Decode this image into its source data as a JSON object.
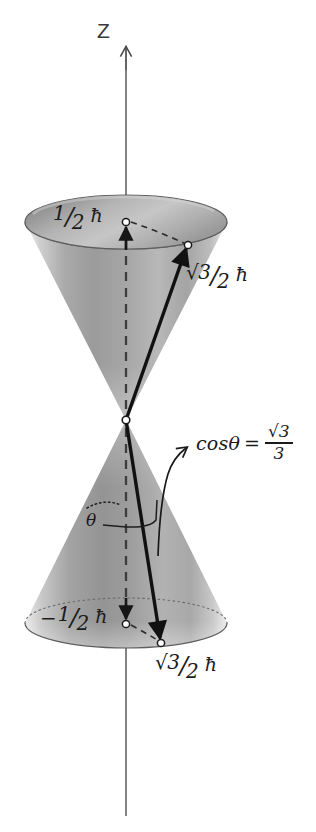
{
  "figure": {
    "axis": {
      "name": "z-axis",
      "label": "Z"
    },
    "labels": {
      "upper_projection": {
        "sign": "",
        "numerator": "1",
        "slash": "/",
        "denominator": "2",
        "unit": "ħ",
        "plain": "1/2 ħ"
      },
      "upper_vector": {
        "radical": "√3",
        "slash": "/",
        "denominator": "2",
        "unit": "ħ",
        "plain": "√3/2 ħ"
      },
      "lower_projection": {
        "sign": "−",
        "numerator": "1",
        "slash": "/",
        "denominator": "2",
        "unit": "ħ",
        "plain": "−1/2 ħ"
      },
      "lower_vector": {
        "radical": "√3",
        "slash": "/",
        "denominator": "2",
        "unit": "ħ",
        "plain": "√3/2 ħ"
      },
      "angle": {
        "symbol": "θ"
      },
      "cos_annotation": {
        "lhs": "cosθ",
        "equals": "=",
        "numerator": "√3",
        "denominator": "3",
        "plain": "cosθ = √3/3"
      }
    },
    "colors": {
      "ink": "#1c1c1c",
      "axis_line": "#555555",
      "cone_light": "#e2e2e2",
      "cone_mid": "#b4b4b4",
      "cone_dark": "#8c8c8c",
      "ellipse_top_dark": "#8a8a8a",
      "ellipse_top_light": "#d2d2d2",
      "marker_fill": "#ffffff",
      "background": "#ffffff"
    },
    "geometry": {
      "axis_x": 126,
      "axis_top_y": 46,
      "axis_bottom_y": 816,
      "apex_x": 126,
      "apex_y": 420,
      "top_ellipse_cx": 126,
      "top_ellipse_cy": 222,
      "top_ellipse_rx": 101,
      "top_ellipse_ry": 27,
      "bottom_ellipse_cx": 126,
      "bottom_ellipse_cy": 623,
      "bottom_ellipse_rx": 101,
      "bottom_ellipse_ry": 25,
      "upper_vector_tip_x": 188,
      "upper_vector_tip_y": 245,
      "lower_vector_tip_x": 161,
      "lower_vector_tip_y": 643
    }
  }
}
